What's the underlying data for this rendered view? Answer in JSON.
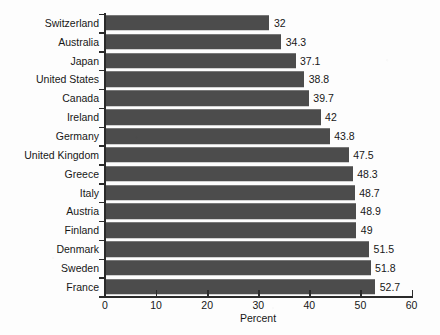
{
  "chart_data": {
    "type": "bar",
    "orientation": "horizontal",
    "title": "",
    "subtitle": "",
    "xlabel": "Percent",
    "ylabel": "",
    "xlim": [
      0,
      60
    ],
    "xticks": [
      0,
      10,
      20,
      30,
      40,
      50,
      60
    ],
    "xtick_labels": [
      "0",
      "10",
      "20",
      "30",
      "40",
      "50",
      "60"
    ],
    "grid": false,
    "legend": null,
    "bar_color": "#4c4c4c",
    "axis_color": "#2a2a2a",
    "background_color": "#fdfdfd",
    "categories": [
      "Switzerland",
      "Australia",
      "Japan",
      "United States",
      "Canada",
      "Ireland",
      "Germany",
      "United Kingdom",
      "Greece",
      "Italy",
      "Austria",
      "Finland",
      "Denmark",
      "Sweden",
      "France"
    ],
    "values": [
      32,
      34.3,
      37.1,
      38.8,
      39.7,
      42,
      43.8,
      47.5,
      48.3,
      48.7,
      48.9,
      49,
      51.5,
      51.8,
      52.7
    ],
    "value_labels": [
      "32",
      "34.3",
      "37.1",
      "38.8",
      "39.7",
      "42",
      "43.8",
      "47.5",
      "48.3",
      "48.7",
      "48.9",
      "49",
      "51.5",
      "51.8",
      "52.7"
    ]
  }
}
